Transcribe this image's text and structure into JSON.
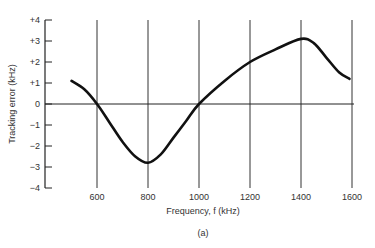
{
  "chart_data": {
    "type": "line",
    "title": "",
    "caption": "(a)",
    "xlabel": "Frequency, f (kHz)",
    "ylabel": "Tracking error (kHz)",
    "xlim": [
      450,
      1650
    ],
    "ylim": [
      -4,
      4
    ],
    "x_ticks": [
      600,
      800,
      1000,
      1200,
      1400,
      1600
    ],
    "x_tick_labels": [
      "600",
      "800",
      "1000",
      "1200",
      "1400",
      "1600"
    ],
    "y_ticks": [
      4,
      3,
      2,
      1,
      0,
      -1,
      -2,
      -3,
      -4
    ],
    "y_tick_labels": [
      "+4",
      "+3",
      "+2",
      "+1",
      "0",
      "−1",
      "−2",
      "−3",
      "−4"
    ],
    "grid": {
      "vertical": true,
      "horizontal": false,
      "zero_line": true
    },
    "legend": null,
    "series": [
      {
        "name": "Tracking error",
        "x": [
          500,
          550,
          600,
          650,
          700,
          750,
          800,
          850,
          900,
          950,
          1000,
          1100,
          1200,
          1300,
          1400,
          1450,
          1500,
          1550,
          1590
        ],
        "y": [
          1.1,
          0.7,
          0.0,
          -0.9,
          -1.8,
          -2.5,
          -2.8,
          -2.4,
          -1.6,
          -0.8,
          0.0,
          1.1,
          2.0,
          2.6,
          3.1,
          2.9,
          2.2,
          1.5,
          1.2
        ]
      }
    ]
  }
}
